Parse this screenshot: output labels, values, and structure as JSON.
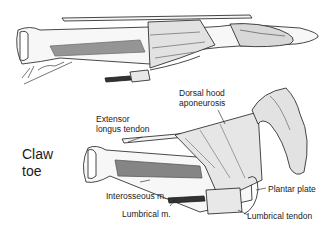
{
  "figure": {
    "title_line1": "Claw",
    "title_line2": "toe",
    "signature": "M. Simard"
  },
  "labels": {
    "dorsal_hood_line1": "Dorsal hood",
    "dorsal_hood_line2": "aponeurosis",
    "extensor_line1": "Extensor",
    "extensor_line2": "longus tendon",
    "interosseous": "Interosseous m.",
    "lumbrical_m": "Lumbrical m.",
    "plantar_plate": "Plantar plate",
    "lumbrical_tendon": "Lumbrical tendon"
  },
  "colors": {
    "ink": "#1a1a1a",
    "background": "#ffffff"
  }
}
